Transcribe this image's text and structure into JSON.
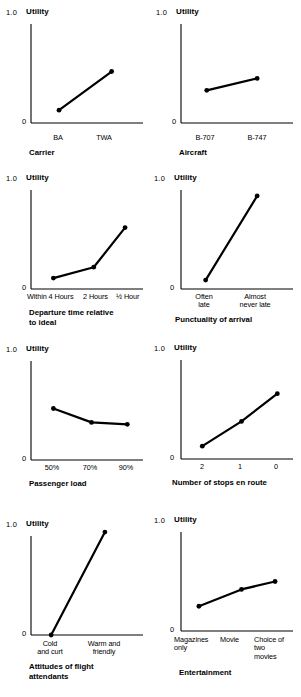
{
  "figure": {
    "title": "",
    "axis_y_label": "Utility",
    "y_max_label": "1.0",
    "y_min_label": "0"
  },
  "chart_data": [
    {
      "type": "line",
      "title": "Carrier",
      "ylabel": "Utility",
      "xlabel": "Carrier",
      "categories": [
        "BA",
        "TWA"
      ],
      "values": [
        0.13,
        0.52
      ],
      "ylim": [
        0,
        1.0
      ],
      "ytick_labels": [
        "0",
        "1.0"
      ],
      "grid": false,
      "legend": "none"
    },
    {
      "type": "line",
      "title": "Aircraft",
      "ylabel": "Utility",
      "xlabel": "Aircraft",
      "categories": [
        "B-707",
        "B-747"
      ],
      "values": [
        0.33,
        0.45
      ],
      "ylim": [
        0,
        1.0
      ],
      "ytick_labels": [
        "0",
        "1.0"
      ],
      "grid": false,
      "legend": "none"
    },
    {
      "type": "line",
      "title": "Departure time relative\nto ideal",
      "ylabel": "Utility",
      "xlabel": "Departure time relative to ideal",
      "categories": [
        "Within 4 Hours",
        "2 Hours",
        "½ Hour"
      ],
      "values": [
        0.11,
        0.22,
        0.62
      ],
      "ylim": [
        0,
        1.0
      ],
      "ytick_labels": [
        "0",
        "1.0"
      ],
      "grid": false,
      "legend": "none"
    },
    {
      "type": "line",
      "title": "Punctuality of arrival",
      "ylabel": "Utility",
      "xlabel": "Punctuality of arrival",
      "categories": [
        "Often\nlate",
        "Almost\nnever late"
      ],
      "values": [
        0.09,
        0.94
      ],
      "ylim": [
        0,
        1.0
      ],
      "ytick_labels": [
        "0",
        "1.0"
      ],
      "grid": false,
      "legend": "none"
    },
    {
      "type": "line",
      "title": "Passenger load",
      "ylabel": "Utility",
      "xlabel": "Passenger load",
      "categories": [
        "50%",
        "70%",
        "90%"
      ],
      "values": [
        0.52,
        0.38,
        0.36
      ],
      "ylim": [
        0,
        1.0
      ],
      "ytick_labels": [
        "0",
        "1.0"
      ],
      "grid": false,
      "legend": "none"
    },
    {
      "type": "line",
      "title": "Number of stops en route",
      "ylabel": "Utility",
      "xlabel": "Number of stops en route",
      "categories": [
        "2",
        "1",
        "0"
      ],
      "values": [
        0.13,
        0.38,
        0.66
      ],
      "ylim": [
        0,
        1.0
      ],
      "ytick_labels": [
        "0",
        "1.0"
      ],
      "grid": false,
      "legend": "none"
    },
    {
      "type": "line",
      "title": "Attitudes of flight\nattendants",
      "ylabel": "Utility",
      "xlabel": "Attitudes of flight attendants",
      "categories": [
        "Cold\nand curt",
        "Warm and\nfriendly"
      ],
      "values": [
        0.0,
        1.04
      ],
      "ylim": [
        0,
        1.0
      ],
      "ytick_labels": [
        "0",
        "1.0"
      ],
      "grid": false,
      "legend": "none"
    },
    {
      "type": "line",
      "title": "Entertainment",
      "ylabel": "Utility",
      "xlabel": "Entertainment",
      "categories": [
        "Magazines\nonly",
        "Movie",
        "Choice of\ntwo\nmovies"
      ],
      "values": [
        0.25,
        0.42,
        0.5
      ],
      "ylim": [
        0,
        1.0
      ],
      "ytick_labels": [
        "0",
        "1.0"
      ],
      "grid": false,
      "legend": "none"
    }
  ],
  "panels": [
    {
      "y_max_label": "1.0",
      "y_min_label": "0",
      "utility_label": "Utility",
      "caption": "Carrier",
      "ticks": [
        "BA",
        "TWA"
      ]
    },
    {
      "y_max_label": "1.0",
      "y_min_label": "0",
      "utility_label": "Utility",
      "caption": "Aircraft",
      "ticks": [
        "B-707",
        "B-747"
      ]
    },
    {
      "y_max_label": "1.0",
      "y_min_label": "0",
      "utility_label": "Utility",
      "caption": "Departure time relative\nto ideal",
      "ticks": [
        "Within 4 Hours",
        "2 Hours",
        "½ Hour"
      ]
    },
    {
      "y_max_label": "1.0",
      "y_min_label": "0",
      "utility_label": "Utility",
      "caption": "Punctuality of arrival",
      "ticks": [
        "Often\nlate",
        "Almost\nnever late"
      ]
    },
    {
      "y_max_label": "1.0",
      "y_min_label": "0",
      "utility_label": "Utility",
      "caption": "Passenger load",
      "ticks": [
        "50%",
        "70%",
        "90%"
      ]
    },
    {
      "y_max_label": "1.0",
      "y_min_label": "0",
      "utility_label": "Utility",
      "caption": "Number of stops en route",
      "ticks": [
        "2",
        "1",
        "0"
      ]
    },
    {
      "y_max_label": "1.0",
      "y_min_label": "0",
      "utility_label": "Utility",
      "caption": "Attitudes of flight\nattendants",
      "ticks": [
        "Cold\nand curt",
        "Warm and\nfriendly"
      ]
    },
    {
      "y_max_label": "1.0",
      "y_min_label": "0",
      "utility_label": "Utility",
      "caption": "Entertainment",
      "ticks": [
        "Magazines\nonly",
        "Movie",
        "Choice of\ntwo\nmovies"
      ]
    }
  ],
  "style": {
    "line_color": "#000000",
    "axis_color": "#000000",
    "background": "#ffffff"
  }
}
